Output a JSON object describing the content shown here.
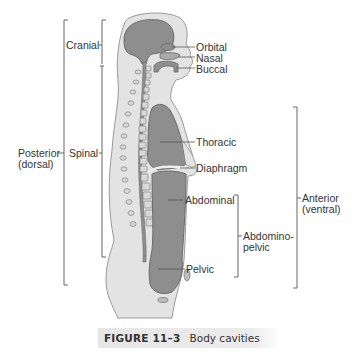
{
  "figure": {
    "number": "FIGURE 11–3",
    "title": "Body cavities"
  },
  "labels": {
    "posterior": [
      "Posterior",
      "(dorsal)"
    ],
    "cranial": "Cranial",
    "spinal": "Spinal",
    "orbital": "Orbital",
    "nasal": "Nasal",
    "buccal": "Buccal",
    "thoracic": "Thoracic",
    "diaphragm": "Diaphragm",
    "abdominal": "Abdominal",
    "abdominopelvic": [
      "Abdomino-",
      "pelvic"
    ],
    "pelvic": "Pelvic",
    "anterior": [
      "Anterior",
      "(ventral)"
    ]
  },
  "colors": {
    "body_fill": "#e3e3e3",
    "body_outline": "#9a9a9a",
    "cavity_fill": "#8e8e8e",
    "cavity_outline": "#6a6a6a",
    "bone_fill": "#d8d8d8",
    "line": "#555555"
  }
}
